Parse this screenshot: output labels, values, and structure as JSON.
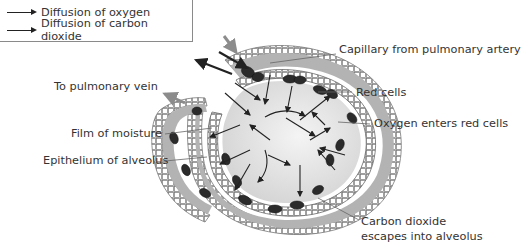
{
  "legend": {
    "items": [
      {
        "label": "Diffusion of oxygen",
        "icon": "arrow-right-icon"
      },
      {
        "label": "Diffusion of carbon dioxide",
        "icon": "arrow-right-icon"
      }
    ]
  },
  "labels": {
    "capillary": "Capillary from pulmonary artery",
    "pulmonary_vein": "To pulmonary vein",
    "red_cells": "Red cells",
    "moisture": "Film of moisture",
    "oxygen_enters": "Oxygen enters red cells",
    "epithelium": "Epithelium of alveolus",
    "co2_line1": "Carbon dioxide",
    "co2_line2": "escapes into alveolus"
  },
  "colors": {
    "capillary_fill": "#b3b3b3",
    "epithelium_fill": "#c8c8c8",
    "alveolus_fill": "#e6e6e6",
    "red_cell": "#2b2b2b",
    "flow_arrow": "#8c8c8c",
    "text": "#333333"
  }
}
